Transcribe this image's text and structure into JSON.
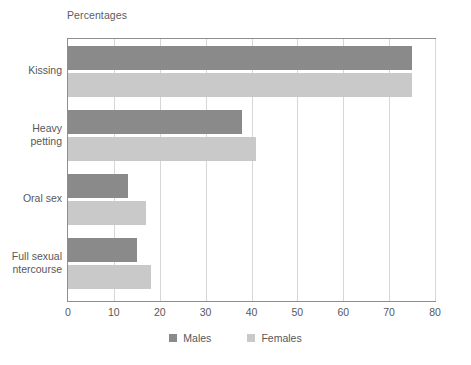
{
  "chart_data": {
    "type": "bar",
    "orientation": "horizontal",
    "title": "Percentages",
    "xlabel": "",
    "ylabel": "",
    "xlim": [
      0,
      80
    ],
    "xticks": [
      "0",
      "10",
      "20",
      "30",
      "40",
      "50",
      "60",
      "70",
      "80"
    ],
    "grid": "vertical",
    "legend_position": "bottom",
    "categories": [
      "Kissing",
      "Heavy\npetting",
      "Oral sex",
      "Full sexual\nntercourse"
    ],
    "series": [
      {
        "name": "Males",
        "color": "#8a8a8a",
        "values": [
          75,
          38,
          13,
          15
        ]
      },
      {
        "name": "Females",
        "color": "#c9c9c9",
        "values": [
          75,
          41,
          17,
          18
        ]
      }
    ]
  },
  "legend": {
    "items": [
      {
        "label": "Males"
      },
      {
        "label": "Females"
      }
    ]
  }
}
